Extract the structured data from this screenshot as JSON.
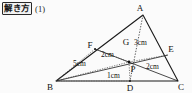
{
  "header": {
    "tag": "解き方",
    "number": "(1)"
  },
  "figure": {
    "name": "triangle-cevian-diagram",
    "vertices": {
      "A": "A",
      "B": "B",
      "C": "C",
      "D": "D",
      "E": "E",
      "F": "F",
      "G": "G",
      "P": "P"
    },
    "lengths": {
      "ag": "3cm",
      "fg": "2cm",
      "ec": "2cm",
      "bp": "5cm",
      "dp": "1cm"
    },
    "colors": {
      "stroke": "#1a1a1a",
      "background": "#fbfbfb"
    }
  }
}
